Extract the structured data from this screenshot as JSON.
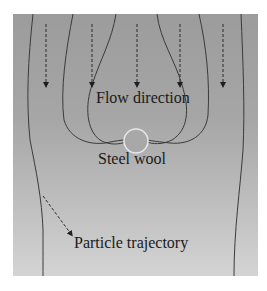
{
  "figure": {
    "type": "flow-field-diagram",
    "background_gradient": [
      "#9c9c9c",
      "#d4d4d4"
    ],
    "line_color": "#3a3a3a",
    "obstacle_color": "#e6e6e6"
  },
  "labels": {
    "flow_direction": "Flow direction",
    "steel_wool": "Steel wool",
    "particle_trajectory": "Particle trajectory"
  },
  "flow_arrows": {
    "count": 5,
    "style": "dashed-down-arrow",
    "x_positions": [
      46,
      92,
      137,
      180,
      223
    ]
  },
  "streamlines": {
    "count": 6,
    "style": "solid-curve"
  },
  "obstacle": {
    "name": "steel wool",
    "shape": "circle"
  },
  "trajectory_arrow": {
    "style": "dashed-diagonal-arrow"
  }
}
